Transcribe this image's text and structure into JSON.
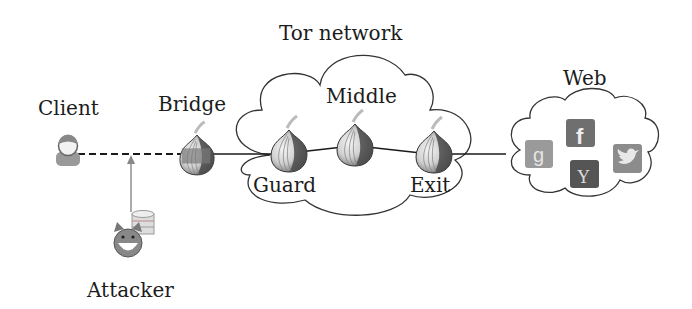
{
  "title": "Tor network",
  "nodes": {
    "client": {
      "label": "Client"
    },
    "bridge": {
      "label": "Bridge"
    },
    "guard": {
      "label": "Guard"
    },
    "middle": {
      "label": "Middle"
    },
    "exit": {
      "label": "Exit"
    },
    "web": {
      "label": "Web"
    },
    "attacker": {
      "label": "Attacker"
    }
  },
  "web_services": [
    "google-plus",
    "facebook",
    "yahoo",
    "twitter"
  ],
  "web_service_glyphs": {
    "google": "g",
    "facebook": "f",
    "yahoo": "Y"
  },
  "edges": [
    {
      "from": "client",
      "to": "bridge",
      "style": "dashed"
    },
    {
      "from": "bridge",
      "to": "guard",
      "style": "solid"
    },
    {
      "from": "guard",
      "to": "middle",
      "style": "solid"
    },
    {
      "from": "middle",
      "to": "exit",
      "style": "solid"
    },
    {
      "from": "exit",
      "to": "web",
      "style": "solid"
    },
    {
      "from": "attacker",
      "to": "client-bridge-link",
      "style": "arrow"
    }
  ],
  "colors": {
    "line": "#1a1a1a",
    "cloud_stroke": "#333333",
    "onion_dark": "#5a5a5a",
    "onion_light": "#e8e8e8",
    "icon_grey": "#8a8a8a"
  }
}
